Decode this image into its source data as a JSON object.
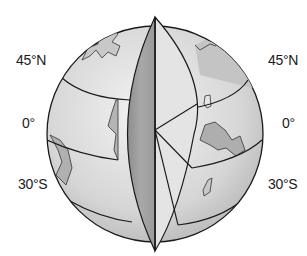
{
  "diagram": {
    "labels_left": [
      {
        "text": "45°N",
        "y": 52
      },
      {
        "text": "0°",
        "y": 115
      },
      {
        "text": "30°S",
        "y": 176
      }
    ],
    "labels_right": [
      {
        "text": "45°N",
        "y": 52
      },
      {
        "text": "0°",
        "y": 115
      },
      {
        "text": "30°S",
        "y": 176
      }
    ],
    "colors": {
      "outline": "#1a1a1a",
      "globe_fill": "#dcdcdc",
      "cut_face_dark": "#9a9a9a",
      "cut_face_light": "#e2e2e2",
      "land": "#bcbcbc"
    }
  }
}
